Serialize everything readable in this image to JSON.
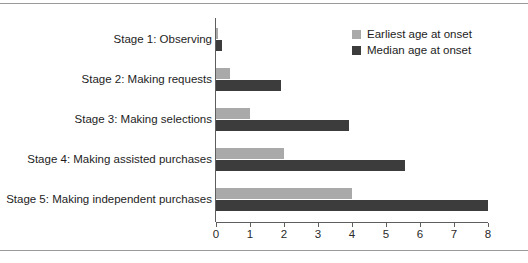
{
  "chart_data": {
    "type": "bar",
    "orientation": "horizontal",
    "title": "",
    "xlabel": "",
    "ylabel": "",
    "xlim": [
      0,
      8
    ],
    "xticks": [
      0,
      1,
      2,
      3,
      4,
      5,
      6,
      7,
      8
    ],
    "xtick_labels": [
      "0",
      "1",
      "2",
      "3",
      "4",
      "5",
      "6",
      "7",
      "8"
    ],
    "grid": false,
    "legend_position": "top-right",
    "categories": [
      "Stage 1: Observing",
      "Stage 2: Making requests",
      "Stage 3: Making selections",
      "Stage 4: Making assisted purchases",
      "Stage 5: Making independent purchases"
    ],
    "series": [
      {
        "name": "Earliest age at onset",
        "color": "#a9a9a9",
        "values": [
          0.05,
          0.4,
          1.0,
          2.0,
          4.0
        ]
      },
      {
        "name": "Median age at onset",
        "color": "#3c3c3c",
        "values": [
          0.17,
          1.9,
          3.9,
          5.55,
          8.0
        ]
      }
    ]
  },
  "legend": {
    "items": [
      {
        "label": "Earliest age at onset",
        "swatch": "earliest"
      },
      {
        "label": "Median age at onset",
        "swatch": "median"
      }
    ]
  },
  "colors": {
    "earliest": "#a9a9a9",
    "median": "#3c3c3c",
    "axis": "#5e5e5e",
    "rule": "#9a9a9a",
    "background": "#ffffff"
  }
}
